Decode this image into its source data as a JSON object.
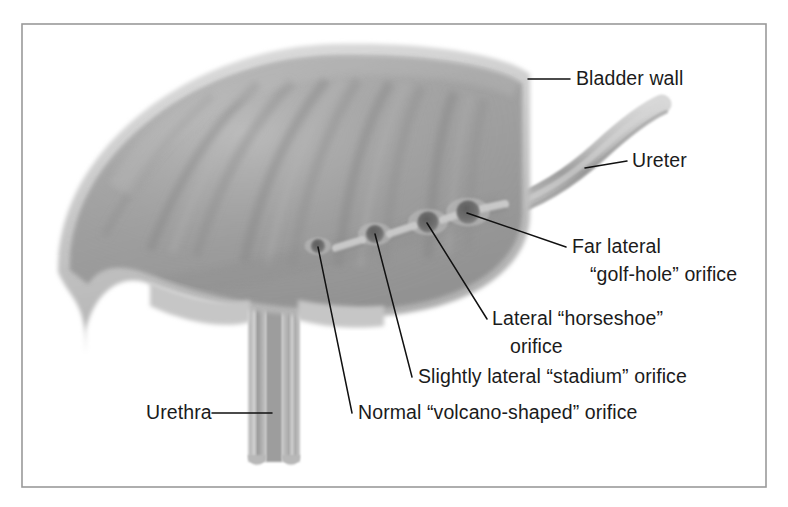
{
  "figure": {
    "frame_color": "#9a9a9a",
    "background_color": "#ffffff"
  },
  "colors": {
    "wall_rim": "#cfcfcf",
    "wall_rim_shadow": "#b4b4b4",
    "interior_light": "#b9b9b9",
    "interior_mid": "#9d9d9d",
    "interior_dark": "#8a8a8a",
    "orifice_dark": "#6e6e6e",
    "leader_line": "#111111",
    "text": "#1b1b1b"
  },
  "labels": [
    {
      "id": "bladder-wall",
      "name": "bladder-wall-label",
      "lines": [
        "Bladder wall"
      ],
      "x": 576,
      "y": 85,
      "anchor": "start"
    },
    {
      "id": "ureter",
      "name": "ureter-label",
      "lines": [
        "Ureter"
      ],
      "x": 632,
      "y": 167,
      "anchor": "start"
    },
    {
      "id": "far-lateral",
      "name": "far-lateral-golf-hole-label",
      "lines": [
        "Far lateral",
        "“golf-hole” orifice"
      ],
      "x": 572,
      "y": 253,
      "anchor": "start"
    },
    {
      "id": "lateral-horseshoe",
      "name": "lateral-horseshoe-label",
      "lines": [
        "Lateral “horseshoe”",
        "orifice"
      ],
      "x": 492,
      "y": 325,
      "anchor": "start"
    },
    {
      "id": "slightly-lateral",
      "name": "slightly-lateral-stadium-label",
      "lines": [
        "Slightly lateral “stadium” orifice"
      ],
      "x": 418,
      "y": 383,
      "anchor": "start"
    },
    {
      "id": "normal-volcano",
      "name": "normal-volcano-shaped-label",
      "lines": [
        "Normal “volcano-shaped” orifice"
      ],
      "x": 358,
      "y": 419,
      "anchor": "start"
    },
    {
      "id": "urethra",
      "name": "urethra-label",
      "lines": [
        "Urethra"
      ],
      "x": 146,
      "y": 419,
      "anchor": "start"
    }
  ],
  "leaders": [
    {
      "id": "bladder-wall",
      "name": "leader-bladder-wall",
      "d": "M 528 79 L 570 79"
    },
    {
      "id": "ureter",
      "name": "leader-ureter",
      "d": "M 585 168 L 627 161"
    },
    {
      "id": "far-lateral",
      "name": "leader-far-lateral",
      "d": "M 467 213 L 566 247"
    },
    {
      "id": "lateral-horseshoe",
      "name": "leader-lateral-horseshoe",
      "d": "M 427 223 L 487 319"
    },
    {
      "id": "slightly-lateral",
      "name": "leader-slightly-lateral",
      "d": "M 375 234 L 412 377"
    },
    {
      "id": "normal-volcano",
      "name": "leader-normal-volcano",
      "d": "M 318 247 L 352 413"
    },
    {
      "id": "urethra",
      "name": "leader-urethra",
      "d": "M 212 413 L 272 413"
    }
  ],
  "orifices": [
    {
      "id": "normal-volcano",
      "name": "orifice-normal-volcano",
      "cx": 318,
      "cy": 246,
      "r": 7.0,
      "description": "Normal volcano-shaped orifice"
    },
    {
      "id": "slightly-lateral",
      "name": "orifice-slightly-lateral",
      "cx": 375,
      "cy": 234,
      "r": 9.0,
      "description": "Slightly lateral stadium orifice"
    },
    {
      "id": "lateral-horseshoe",
      "name": "orifice-lateral-horseshoe",
      "cx": 428,
      "cy": 222,
      "r": 10.5,
      "description": "Lateral horseshoe orifice"
    },
    {
      "id": "far-lateral",
      "name": "orifice-far-lateral",
      "cx": 468,
      "cy": 212,
      "r": 11.5,
      "description": "Far lateral golf-hole orifice"
    }
  ],
  "ridges": [
    {
      "name": "trigone-ridge-1",
      "x1": 336,
      "y1": 248,
      "x2": 362,
      "y2": 240
    },
    {
      "name": "trigone-ridge-2",
      "x1": 390,
      "y1": 234,
      "x2": 414,
      "y2": 226
    },
    {
      "name": "trigone-ridge-3",
      "x1": 443,
      "y1": 220,
      "x2": 458,
      "y2": 215
    },
    {
      "name": "trigone-ridge-4",
      "x1": 482,
      "y1": 209,
      "x2": 505,
      "y2": 204
    }
  ],
  "anatomy": {
    "bladder_dome": "large dome-shaped bladder occupying upper-left, pale rim with gray textured interior showing rugae folds",
    "ureter": "tube entering bladder from the upper right, curving down to the far lateral orifice",
    "urethra": "vertical tube descending from the bladder neck at lower center",
    "rugae_count": 9
  }
}
